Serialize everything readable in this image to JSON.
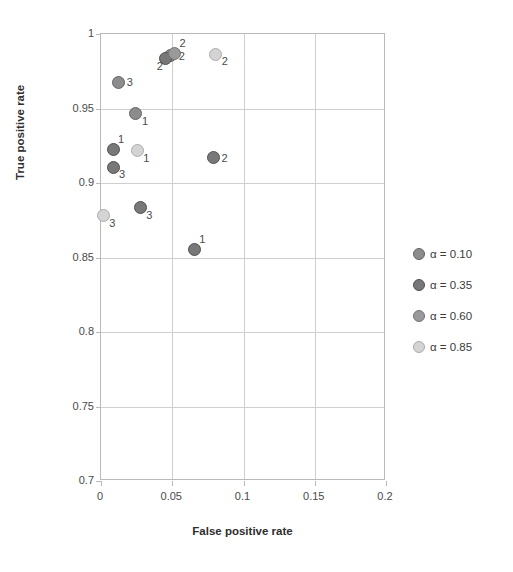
{
  "chart_data": {
    "type": "scatter",
    "title": "",
    "xlabel": "False positive rate",
    "ylabel": "True positive rate",
    "xlim": [
      0,
      0.2
    ],
    "ylim": [
      0.7,
      1
    ],
    "xticks": [
      "0",
      "0.05",
      "0.1",
      "0.15",
      "0.2"
    ],
    "xtick_values": [
      0,
      0.05,
      0.1,
      0.15,
      0.2
    ],
    "yticks": [
      "0.7",
      "0.75",
      "0.8",
      "0.85",
      "0.9",
      "0.95",
      "1"
    ],
    "ytick_values": [
      0.7,
      0.75,
      0.8,
      0.85,
      0.9,
      0.95,
      1
    ],
    "grid": true,
    "legend_position": "right",
    "series": [
      {
        "name": "α = 0.10",
        "color": "#8c8c8c",
        "points": [
          {
            "x": 0.049,
            "y": 0.9855,
            "label": "2",
            "label_pos": "right"
          },
          {
            "x": 0.0125,
            "y": 0.9675,
            "label": "3",
            "label_pos": "right"
          },
          {
            "x": 0.0245,
            "y": 0.9465,
            "label": "1",
            "label_pos": "below-right"
          }
        ]
      },
      {
        "name": "α = 0.35",
        "color": "#787878",
        "points": [
          {
            "x": 0.0455,
            "y": 0.9835,
            "label": "2",
            "label_pos": "below-left"
          },
          {
            "x": 0.0085,
            "y": 0.9225,
            "label": "1",
            "label_pos": "above-right"
          },
          {
            "x": 0.0085,
            "y": 0.9105,
            "label": "3",
            "label_pos": "below-right"
          },
          {
            "x": 0.0275,
            "y": 0.8835,
            "label": "3",
            "label_pos": "below-right"
          },
          {
            "x": 0.0655,
            "y": 0.8555,
            "label": "1",
            "label_pos": "above-right"
          },
          {
            "x": 0.079,
            "y": 0.917,
            "label": "2",
            "label_pos": "right"
          }
        ]
      },
      {
        "name": "α = 0.60",
        "color": "#9a9a9a",
        "points": [
          {
            "x": 0.0515,
            "y": 0.987,
            "label": "2",
            "label_pos": "above-right"
          }
        ]
      },
      {
        "name": "α = 0.85",
        "color": "#d4d4d4",
        "points": [
          {
            "x": 0.0805,
            "y": 0.9865,
            "label": "2",
            "label_pos": "below-right"
          },
          {
            "x": 0.0255,
            "y": 0.9215,
            "label": "1",
            "label_pos": "below-right"
          },
          {
            "x": 0.0015,
            "y": 0.878,
            "label": "3",
            "label_pos": "below-right"
          }
        ]
      }
    ]
  },
  "legend": {
    "items": [
      {
        "label": "α = 0.10",
        "color": "#8c8c8c"
      },
      {
        "label": "α = 0.35",
        "color": "#787878"
      },
      {
        "label": "α = 0.60",
        "color": "#9a9a9a"
      },
      {
        "label": "α = 0.85",
        "color": "#d4d4d4"
      }
    ]
  }
}
